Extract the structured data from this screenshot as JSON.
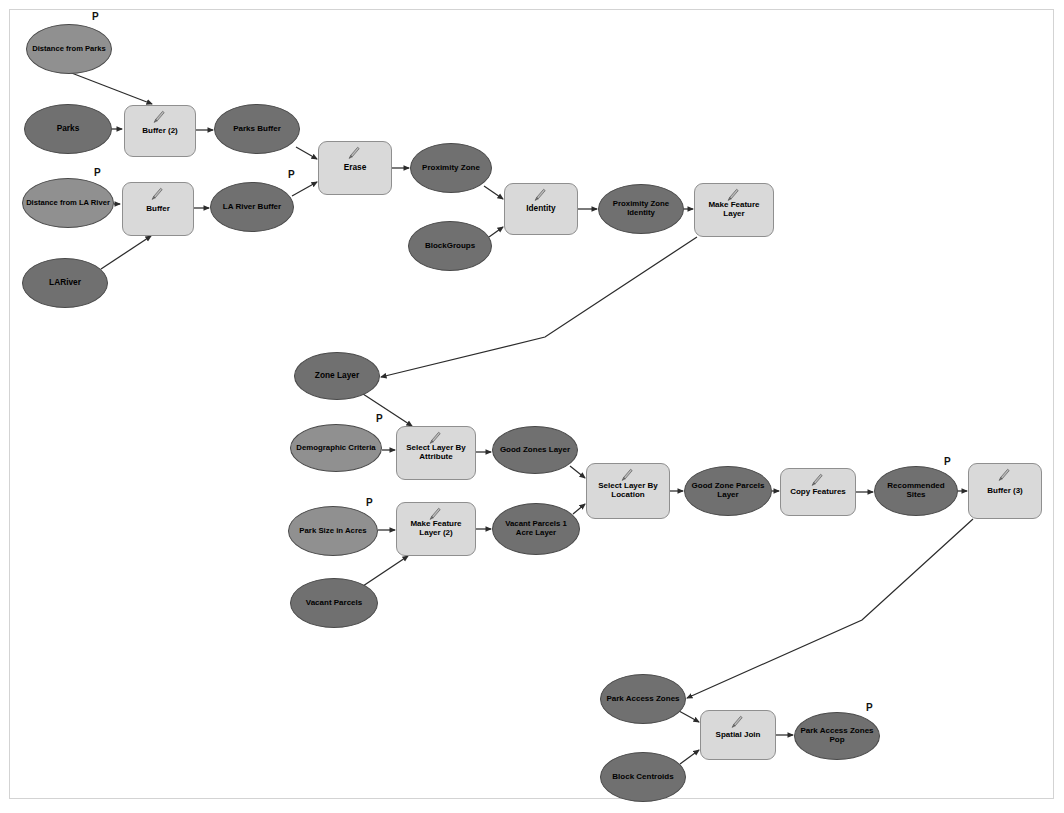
{
  "diagram": {
    "type": "geoprocessing-model-flowchart",
    "colors": {
      "canvas": "#ffffff",
      "frame_border": "#d3d3d3",
      "data_oval": "#707070",
      "parameter_oval": "#909090",
      "tool_box": "#d9d9d9",
      "tool_border": "#8f8f8f",
      "oval_border": "#4a4a4a",
      "connector": "#2b2b2b",
      "label_text": "#000000"
    },
    "parameter_marker": "P",
    "nodes": [
      {
        "id": "distance_from_parks",
        "label": "Distance from Parks",
        "shape": "ellipse",
        "kind": "parameter",
        "x": 26,
        "y": 24,
        "w": 86,
        "h": 50,
        "font": 7.6,
        "param": true,
        "px": 92,
        "py": 12
      },
      {
        "id": "parks",
        "label": "Parks",
        "shape": "ellipse",
        "kind": "data",
        "x": 24,
        "y": 104,
        "w": 88,
        "h": 50,
        "font": 8.3,
        "param": false
      },
      {
        "id": "buffer_2",
        "label": "Buffer (2)",
        "shape": "tool",
        "kind": "tool",
        "x": 124,
        "y": 105,
        "w": 72,
        "h": 52,
        "font": 8.0,
        "param": false
      },
      {
        "id": "parks_buffer",
        "label": "Parks Buffer",
        "shape": "ellipse",
        "kind": "data",
        "x": 214,
        "y": 104,
        "w": 86,
        "h": 50,
        "font": 8.0,
        "param": false
      },
      {
        "id": "distance_from_la_river",
        "label": "Distance from LA River",
        "shape": "ellipse",
        "kind": "parameter",
        "x": 22,
        "y": 178,
        "w": 92,
        "h": 50,
        "font": 7.6,
        "param": true,
        "px": 94,
        "py": 168
      },
      {
        "id": "buffer",
        "label": "Buffer",
        "shape": "tool",
        "kind": "tool",
        "x": 122,
        "y": 182,
        "w": 72,
        "h": 54,
        "font": 8.0,
        "param": false
      },
      {
        "id": "la_river_buffer",
        "label": "LA River Buffer",
        "shape": "ellipse",
        "kind": "data",
        "x": 210,
        "y": 182,
        "w": 84,
        "h": 50,
        "font": 8.0,
        "param": false
      },
      {
        "id": "lariver",
        "label": "LARiver",
        "shape": "ellipse",
        "kind": "data",
        "x": 22,
        "y": 258,
        "w": 86,
        "h": 50,
        "font": 8.3,
        "param": false
      },
      {
        "id": "erase",
        "label": "Erase",
        "shape": "tool",
        "kind": "tool",
        "x": 318,
        "y": 141,
        "w": 74,
        "h": 54,
        "font": 8.3,
        "param": false,
        "pIn": true,
        "px": 288,
        "py": 170
      },
      {
        "id": "proximity_zone",
        "label": "Proximity Zone",
        "shape": "ellipse",
        "kind": "data",
        "x": 410,
        "y": 143,
        "w": 82,
        "h": 50,
        "font": 8.0,
        "param": false
      },
      {
        "id": "blockgroups",
        "label": "BlockGroups",
        "shape": "ellipse",
        "kind": "data",
        "x": 408,
        "y": 221,
        "w": 84,
        "h": 50,
        "font": 8.0,
        "param": false
      },
      {
        "id": "identity",
        "label": "Identity",
        "shape": "tool",
        "kind": "tool",
        "x": 504,
        "y": 183,
        "w": 74,
        "h": 52,
        "font": 8.3,
        "param": false
      },
      {
        "id": "proximity_zone_identity",
        "label": "Proximity Zone Identity",
        "shape": "ellipse",
        "kind": "data",
        "x": 598,
        "y": 184,
        "w": 86,
        "h": 50,
        "font": 7.8,
        "param": false
      },
      {
        "id": "make_feature_layer",
        "label": "Make Feature Layer",
        "shape": "tool",
        "kind": "tool",
        "x": 694,
        "y": 183,
        "w": 80,
        "h": 54,
        "font": 8.0,
        "param": false
      },
      {
        "id": "zone_layer",
        "label": "Zone Layer",
        "shape": "ellipse",
        "kind": "data",
        "x": 294,
        "y": 352,
        "w": 86,
        "h": 48,
        "font": 8.3,
        "param": false
      },
      {
        "id": "demographic_criteria",
        "label": "Demographic Criteria",
        "shape": "ellipse",
        "kind": "parameter",
        "x": 290,
        "y": 424,
        "w": 92,
        "h": 48,
        "font": 7.8,
        "param": false
      },
      {
        "id": "select_layer_by_attribute",
        "label": "Select Layer By Attribute",
        "shape": "tool",
        "kind": "tool",
        "x": 396,
        "y": 426,
        "w": 80,
        "h": 54,
        "font": 8.0,
        "param": false,
        "pIn": true,
        "px": 376,
        "py": 414
      },
      {
        "id": "good_zones_layer",
        "label": "Good Zones Layer",
        "shape": "ellipse",
        "kind": "data",
        "x": 492,
        "y": 426,
        "w": 86,
        "h": 48,
        "font": 8.0,
        "param": false
      },
      {
        "id": "park_size_in_acres",
        "label": "Park Size in Acres",
        "shape": "ellipse",
        "kind": "parameter",
        "x": 288,
        "y": 506,
        "w": 90,
        "h": 50,
        "font": 7.8,
        "param": true,
        "px": 366,
        "py": 498
      },
      {
        "id": "make_feature_layer_2",
        "label": "Make Feature Layer (2)",
        "shape": "tool",
        "kind": "tool",
        "x": 396,
        "y": 502,
        "w": 80,
        "h": 54,
        "font": 8.0,
        "param": false
      },
      {
        "id": "vacant_parcels_1_acre_layer",
        "label": "Vacant Parcels 1 Acre Layer",
        "shape": "ellipse",
        "kind": "data",
        "x": 492,
        "y": 503,
        "w": 88,
        "h": 52,
        "font": 7.8,
        "param": false
      },
      {
        "id": "vacant_parcels",
        "label": "Vacant Parcels",
        "shape": "ellipse",
        "kind": "data",
        "x": 290,
        "y": 578,
        "w": 88,
        "h": 50,
        "font": 8.0,
        "param": false
      },
      {
        "id": "select_layer_by_location",
        "label": "Select Layer By Location",
        "shape": "tool",
        "kind": "tool",
        "x": 586,
        "y": 463,
        "w": 84,
        "h": 56,
        "font": 8.0,
        "param": false
      },
      {
        "id": "good_zone_parcels_layer",
        "label": "Good Zone Parcels Layer",
        "shape": "ellipse",
        "kind": "data",
        "x": 684,
        "y": 466,
        "w": 88,
        "h": 50,
        "font": 8.0,
        "param": false
      },
      {
        "id": "copy_features",
        "label": "Copy Features",
        "shape": "tool",
        "kind": "tool",
        "x": 780,
        "y": 468,
        "w": 76,
        "h": 48,
        "font": 8.0,
        "param": false
      },
      {
        "id": "recommended_sites",
        "label": "Recommended Sites",
        "shape": "ellipse",
        "kind": "data",
        "x": 874,
        "y": 466,
        "w": 84,
        "h": 50,
        "font": 8.0,
        "param": true,
        "px": 944,
        "py": 457
      },
      {
        "id": "buffer_3",
        "label": "Buffer (3)",
        "shape": "tool",
        "kind": "tool",
        "x": 968,
        "y": 463,
        "w": 74,
        "h": 56,
        "font": 8.0,
        "param": false
      },
      {
        "id": "park_access_zones",
        "label": "Park Access Zones",
        "shape": "ellipse",
        "kind": "data",
        "x": 600,
        "y": 674,
        "w": 86,
        "h": 50,
        "font": 8.0,
        "param": false
      },
      {
        "id": "block_centroids",
        "label": "Block Centroids",
        "shape": "ellipse",
        "kind": "data",
        "x": 600,
        "y": 752,
        "w": 86,
        "h": 50,
        "font": 8.0,
        "param": false
      },
      {
        "id": "spatial_join",
        "label": "Spatial Join",
        "shape": "tool",
        "kind": "tool",
        "x": 700,
        "y": 710,
        "w": 76,
        "h": 50,
        "font": 8.0,
        "param": false
      },
      {
        "id": "park_access_zones_pop",
        "label": "Park Access Zones Pop",
        "shape": "ellipse",
        "kind": "data",
        "x": 794,
        "y": 712,
        "w": 86,
        "h": 48,
        "font": 8.0,
        "param": true,
        "px": 866,
        "py": 703
      }
    ],
    "edges": [
      {
        "from": "distance_from_parks",
        "to": "buffer_2",
        "points": "69,72 152,104"
      },
      {
        "from": "parks",
        "to": "buffer_2",
        "points": "112,129 122,129"
      },
      {
        "from": "buffer_2",
        "to": "parks_buffer",
        "points": "196,130 213,130"
      },
      {
        "from": "parks_buffer",
        "to": "erase",
        "points": "296,147 317,159"
      },
      {
        "from": "distance_from_la_river",
        "to": "buffer",
        "points": "114,204 120,204"
      },
      {
        "from": "buffer",
        "to": "la_river_buffer",
        "points": "194,208 209,208"
      },
      {
        "from": "lariver",
        "to": "buffer",
        "points": "101,269 151,236"
      },
      {
        "from": "la_river_buffer",
        "to": "erase",
        "points": "292,196 317,182"
      },
      {
        "from": "erase",
        "to": "proximity_zone",
        "points": "392,168 409,168"
      },
      {
        "from": "proximity_zone",
        "to": "identity",
        "points": "484,186 503,199"
      },
      {
        "from": "blockgroups",
        "to": "identity",
        "points": "489,237 503,227"
      },
      {
        "from": "identity",
        "to": "proximity_zone_identity",
        "points": "578,209 597,209"
      },
      {
        "from": "proximity_zone_identity",
        "to": "make_feature_layer",
        "points": "684,209 693,209"
      },
      {
        "from": "make_feature_layer",
        "to": "zone_layer",
        "points": "697,237 545,337 381,377"
      },
      {
        "from": "zone_layer",
        "to": "select_layer_by_attribute",
        "points": "360,392 412,426"
      },
      {
        "from": "demographic_criteria",
        "to": "select_layer_by_attribute",
        "points": "382,450 395,450"
      },
      {
        "from": "select_layer_by_attribute",
        "to": "good_zones_layer",
        "points": "476,452 491,452"
      },
      {
        "from": "good_zones_layer",
        "to": "select_layer_by_location",
        "points": "570,466 585,478"
      },
      {
        "from": "park_size_in_acres",
        "to": "make_feature_layer_2",
        "points": "378,530 395,530"
      },
      {
        "from": "vacant_parcels",
        "to": "make_feature_layer_2",
        "points": "360,588 408,556"
      },
      {
        "from": "make_feature_layer_2",
        "to": "vacant_parcels_1_acre_layer",
        "points": "476,529 491,529"
      },
      {
        "from": "vacant_parcels_1_acre_layer",
        "to": "select_layer_by_location",
        "points": "573,514 585,504"
      },
      {
        "from": "select_layer_by_location",
        "to": "good_zone_parcels_layer",
        "points": "670,491 683,491"
      },
      {
        "from": "good_zone_parcels_layer",
        "to": "copy_features",
        "points": "772,491 779,491"
      },
      {
        "from": "copy_features",
        "to": "recommended_sites",
        "points": "856,492 873,492"
      },
      {
        "from": "recommended_sites",
        "to": "buffer_3",
        "points": "958,491 967,491"
      },
      {
        "from": "buffer_3",
        "to": "park_access_zones",
        "points": "973,519 862,620 687,698"
      },
      {
        "from": "park_access_zones",
        "to": "spatial_join",
        "points": "679,711 699,722"
      },
      {
        "from": "block_centroids",
        "to": "spatial_join",
        "points": "680,764 699,750"
      },
      {
        "from": "spatial_join",
        "to": "park_access_zones_pop",
        "points": "776,735 793,735"
      }
    ]
  }
}
